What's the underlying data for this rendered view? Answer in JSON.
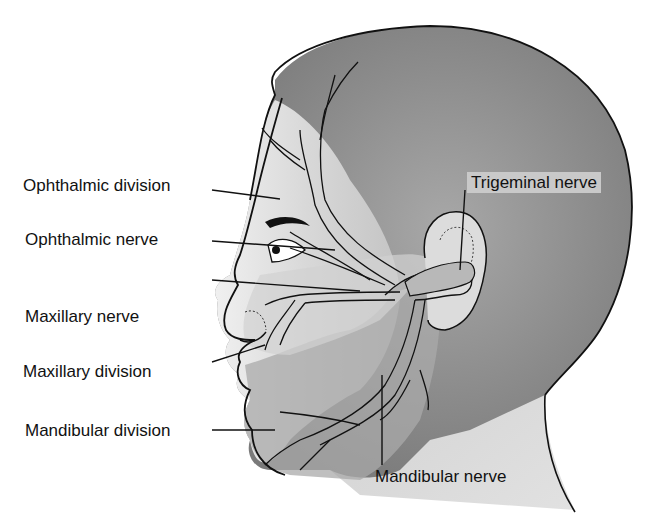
{
  "figure": {
    "labels": {
      "ophthalmic_division": "Ophthalmic division",
      "ophthalmic_nerve": "Ophthalmic nerve",
      "maxillary_nerve": "Maxillary nerve",
      "maxillary_division": "Maxillary division",
      "mandibular_division": "Mandibular division",
      "trigeminal_nerve": "Trigeminal nerve",
      "mandibular_nerve": "Mandibular nerve"
    },
    "colors": {
      "skin_light": "#e6e6e6",
      "skin_mid": "#bdbdbd",
      "hair_dark": "#8a8a8a",
      "nerve": "#b0b0b0",
      "outline": "#111111",
      "label_box": "#c9c9c9"
    }
  }
}
